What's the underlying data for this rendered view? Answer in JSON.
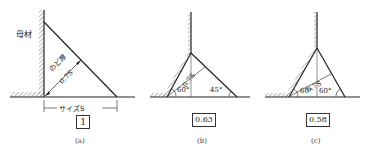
{
  "figures": [
    {
      "id": "a",
      "caption": "(a)",
      "base_metal_label": "母材",
      "throat_label": "のど厚",
      "throat_value": "0.7S",
      "size_label": "サイズS",
      "factor": "1"
    },
    {
      "id": "b",
      "caption": "(b)",
      "throat_value": "0.7S",
      "angle_left": "60°",
      "angle_right": "45°",
      "factor": "0.63"
    },
    {
      "id": "c",
      "caption": "(c)",
      "throat_value": "0.7S",
      "angle_left": "60°",
      "angle_right": "60°",
      "factor": "0.58"
    }
  ],
  "colors": {
    "line": "#222222",
    "hatch": "#555555"
  }
}
